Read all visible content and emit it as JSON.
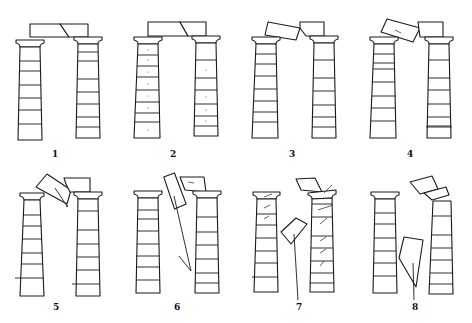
{
  "figure": {
    "stroke_color": "#1a1a1a",
    "background": "#ffffff"
  },
  "panels": [
    {
      "label": "1",
      "state": "intact, two architrave blocks resting on both capitals"
    },
    {
      "label": "2",
      "state": "intact, slight settling of drums"
    },
    {
      "label": "3",
      "state": "left architrave block tilting"
    },
    {
      "label": "4",
      "state": "left architrave block rotating off left column"
    },
    {
      "label": "5",
      "state": "left block falling into gap, arc of motion shown"
    },
    {
      "label": "6",
      "state": "block falling with trajectory line"
    },
    {
      "label": "7",
      "state": "block on ground, right column drums displaced (arrows)"
    },
    {
      "label": "8",
      "state": "block at rest, right capital and architrave tilted"
    }
  ]
}
